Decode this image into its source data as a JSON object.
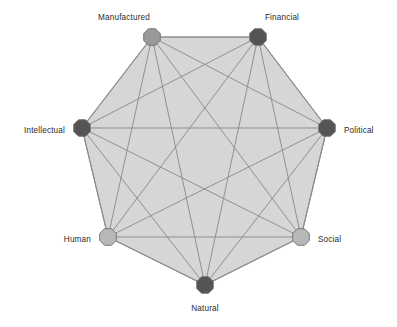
{
  "diagram": {
    "type": "network-octagon",
    "shape": "octagon",
    "node_marker_shape": "octagon",
    "edges_description": "complete graph: every node connected to every other node",
    "canvas": {
      "width": 397,
      "height": 327
    },
    "center": {
      "x": 204.5,
      "y": 161
    },
    "radius": 124,
    "colors": {
      "background": "#ffffff",
      "polygon_fill": "#d6d6d6",
      "polygon_stroke": "#8a8a8a",
      "chord_stroke": "#8c8c8c",
      "node_dark": "#545454",
      "node_mid": "#9a9a9a",
      "node_light": "#b8b8b8",
      "node_outline": "#6f6f6f",
      "label_text": "#2b2b2b"
    },
    "nodes": [
      {
        "id": "manufactured",
        "label": "Manufactured",
        "tone": "mid",
        "fill": "#9a9a9a",
        "cx": 152,
        "cy": 37,
        "r": 9,
        "label_x": 124,
        "label_y": 18,
        "label_anchor": "middle"
      },
      {
        "id": "financial",
        "label": "Financial",
        "tone": "dark",
        "fill": "#545454",
        "cx": 258,
        "cy": 37,
        "r": 9,
        "label_x": 282,
        "label_y": 18,
        "label_anchor": "middle"
      },
      {
        "id": "political",
        "label": "Political",
        "tone": "dark",
        "fill": "#545454",
        "cx": 327,
        "cy": 128,
        "r": 9,
        "label_x": 344,
        "label_y": 131,
        "label_anchor": "start"
      },
      {
        "id": "social",
        "label": "Social",
        "tone": "light",
        "fill": "#b8b8b8",
        "cx": 301,
        "cy": 237,
        "r": 9,
        "label_x": 318,
        "label_y": 240,
        "label_anchor": "start"
      },
      {
        "id": "natural",
        "label": "Natural",
        "tone": "dark",
        "fill": "#545454",
        "cx": 205,
        "cy": 285,
        "r": 9,
        "label_x": 205,
        "label_y": 309,
        "label_anchor": "middle"
      },
      {
        "id": "human",
        "label": "Human",
        "tone": "light",
        "fill": "#b8b8b8",
        "cx": 108,
        "cy": 237,
        "r": 9,
        "label_x": 91,
        "label_y": 240,
        "label_anchor": "end"
      },
      {
        "id": "intellectual",
        "label": "Intellectual",
        "tone": "dark",
        "fill": "#545454",
        "cx": 82,
        "cy": 128,
        "r": 9,
        "label_x": 65,
        "label_y": 131,
        "label_anchor": "end"
      },
      {
        "id": "manufactured_anchor_unused",
        "label": "",
        "tone": "mid",
        "fill": "#9a9a9a",
        "cx": 0,
        "cy": 0,
        "r": 0,
        "label_x": 0,
        "label_y": 0,
        "label_anchor": "middle"
      }
    ],
    "edges": [
      [
        "manufactured",
        "financial"
      ],
      [
        "manufactured",
        "political"
      ],
      [
        "manufactured",
        "social"
      ],
      [
        "manufactured",
        "natural"
      ],
      [
        "manufactured",
        "human"
      ],
      [
        "manufactured",
        "intellectual"
      ],
      [
        "financial",
        "political"
      ],
      [
        "financial",
        "social"
      ],
      [
        "financial",
        "natural"
      ],
      [
        "financial",
        "human"
      ],
      [
        "financial",
        "intellectual"
      ],
      [
        "political",
        "social"
      ],
      [
        "political",
        "natural"
      ],
      [
        "political",
        "human"
      ],
      [
        "political",
        "intellectual"
      ],
      [
        "social",
        "natural"
      ],
      [
        "social",
        "human"
      ],
      [
        "social",
        "intellectual"
      ],
      [
        "natural",
        "human"
      ],
      [
        "natural",
        "intellectual"
      ],
      [
        "human",
        "intellectual"
      ]
    ]
  }
}
